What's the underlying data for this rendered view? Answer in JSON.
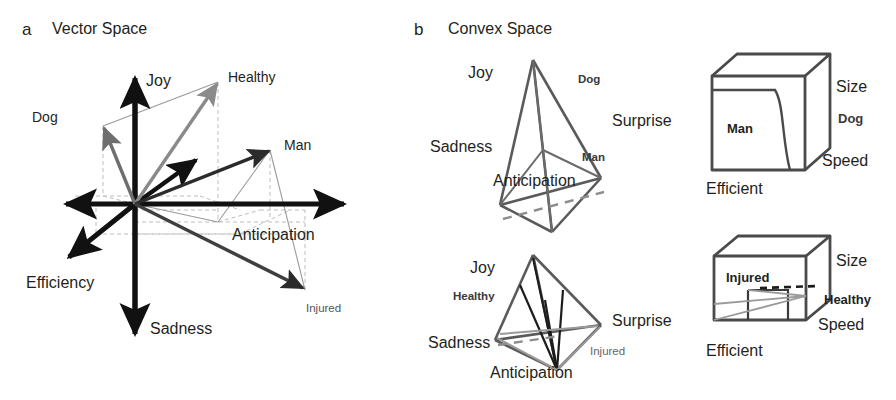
{
  "figure": {
    "panels": [
      {
        "letter": "a",
        "title": "Vector Space",
        "axes": [
          {
            "name": "Joy",
            "label": "Joy"
          },
          {
            "name": "Sadness",
            "label": "Sadness"
          },
          {
            "name": "Anticipation",
            "label": "Anticipation"
          },
          {
            "name": "Efficiency",
            "label": "Efficiency"
          }
        ],
        "vectors": [
          {
            "name": "Dog",
            "label": "Dog",
            "color": "#6e6e6e"
          },
          {
            "name": "Healthy",
            "label": "Healthy",
            "color": "#8a8a8a"
          },
          {
            "name": "Man",
            "label": "Man",
            "color": "#2b2b2b"
          },
          {
            "name": "Injured",
            "label": "Injured",
            "color": "#3f3f3f"
          }
        ]
      },
      {
        "letter": "b",
        "title": "Convex Space",
        "shapes": [
          {
            "name": "tetrahedron-top",
            "kind": "tetrahedron",
            "vertex_labels": [
              "Joy",
              "Surprise",
              "Sadness",
              "Anticipation"
            ],
            "point_labels": [
              "Dog",
              "Man"
            ]
          },
          {
            "name": "cube-top",
            "kind": "cube",
            "axis_labels": [
              "Size",
              "Speed",
              "Efficient"
            ],
            "point_labels": [
              "Dog",
              "Man"
            ]
          },
          {
            "name": "tetrahedron-bottom",
            "kind": "tetrahedron",
            "vertex_labels": [
              "Joy",
              "Surprise",
              "Sadness",
              "Anticipation"
            ],
            "point_labels": [
              "Healthy",
              "Injured"
            ]
          },
          {
            "name": "cube-bottom",
            "kind": "cube",
            "axis_labels": [
              "Size",
              "Speed",
              "Efficient"
            ],
            "point_labels": [
              "Injured",
              "Healthy"
            ]
          }
        ]
      }
    ],
    "labels": {
      "joy": "Joy",
      "sadness": "Sadness",
      "anticipation": "Anticipation",
      "efficiency": "Efficiency",
      "surprise": "Surprise",
      "dog": "Dog",
      "man": "Man",
      "healthy": "Healthy",
      "injured": "Injured",
      "size": "Size",
      "speed": "Speed",
      "efficient": "Efficient"
    },
    "colors": {
      "ink": "#231f20",
      "axis": "#111111",
      "mid_gray": "#6e6e6e",
      "light_gray": "#9a9a9a",
      "dashed_guide": "#b9b9b9",
      "shape_stroke": "#555555",
      "background": "#ffffff"
    }
  }
}
